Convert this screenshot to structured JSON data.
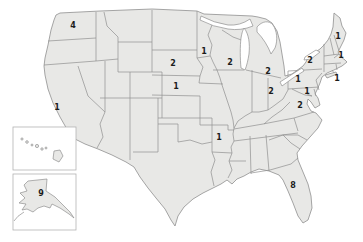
{
  "map": {
    "colors": {
      "background": "#ffffff",
      "land_fill": "#e8e8e6",
      "border": "#8f8f8f",
      "label": "#1c1c1c",
      "inset_border": "#b3b3b3",
      "water": "#ffffff"
    },
    "labels": [
      {
        "state": "washington",
        "value": "4",
        "x": 73,
        "y": 26
      },
      {
        "state": "california",
        "value": "1",
        "x": 57,
        "y": 108
      },
      {
        "state": "south-dakota",
        "value": "2",
        "x": 173,
        "y": 64
      },
      {
        "state": "nebraska",
        "value": "1",
        "x": 176,
        "y": 87
      },
      {
        "state": "minnesota",
        "value": "1",
        "x": 204,
        "y": 52
      },
      {
        "state": "wisconsin",
        "value": "2",
        "x": 230,
        "y": 63
      },
      {
        "state": "michigan",
        "value": "2",
        "x": 268,
        "y": 72
      },
      {
        "state": "ohio",
        "value": "2",
        "x": 271,
        "y": 92
      },
      {
        "state": "pennsylvania",
        "value": "1",
        "x": 298,
        "y": 80
      },
      {
        "state": "new-york",
        "value": "2",
        "x": 310,
        "y": 61
      },
      {
        "state": "maine",
        "value": "1",
        "x": 338,
        "y": 37
      },
      {
        "state": "massachusetts",
        "value": "1",
        "x": 341,
        "y": 56
      },
      {
        "state": "connecticut",
        "value": "1",
        "x": 337,
        "y": 79
      },
      {
        "state": "maryland",
        "value": "1",
        "x": 307,
        "y": 92
      },
      {
        "state": "virginia",
        "value": "2",
        "x": 300,
        "y": 106
      },
      {
        "state": "arkansas",
        "value": "1",
        "x": 219,
        "y": 138
      },
      {
        "state": "florida",
        "value": "8",
        "x": 293,
        "y": 186
      },
      {
        "state": "alaska",
        "value": "9",
        "x": 41,
        "y": 194
      }
    ]
  }
}
